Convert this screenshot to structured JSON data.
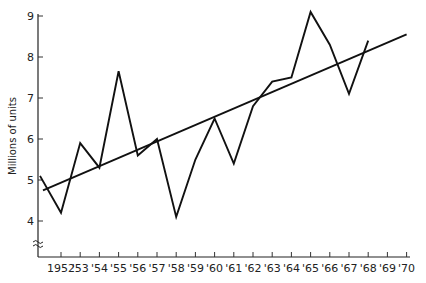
{
  "chart_data": {
    "type": "line",
    "title": "",
    "xlabel": "",
    "ylabel": "Millions of units",
    "ylim": [
      3.1,
      9.1
    ],
    "y_ticks": [
      4,
      5,
      6,
      7,
      8,
      9
    ],
    "y_axis_break": true,
    "grid": false,
    "legend": null,
    "x_ticks": [
      1952,
      1953,
      1954,
      1955,
      1956,
      1957,
      1958,
      1959,
      1960,
      1961,
      1962,
      1963,
      1964,
      1965,
      1966,
      1967,
      1968,
      1969,
      1970
    ],
    "x_tick_labels": [
      "1952",
      "'53",
      "'54",
      "'55",
      "'56",
      "'57",
      "'58",
      "'59",
      "'60",
      "'61",
      "'62",
      "'63",
      "'64",
      "'65",
      "'66",
      "'67",
      "'68",
      "'69",
      "'70"
    ],
    "series": [
      {
        "name": "Actual",
        "x": [
          1951,
          1952,
          1953,
          1954,
          1955,
          1956,
          1957,
          1958,
          1959,
          1960,
          1961,
          1962,
          1963,
          1964,
          1965,
          1966,
          1967,
          1968
        ],
        "values": [
          5.1,
          4.2,
          5.9,
          5.3,
          7.65,
          5.6,
          6.0,
          4.1,
          5.5,
          6.5,
          5.4,
          6.8,
          7.4,
          7.5,
          9.1,
          8.3,
          7.1,
          8.4
        ]
      },
      {
        "name": "Trend",
        "x": [
          1951,
          1970
        ],
        "values": [
          4.75,
          8.55
        ]
      }
    ]
  }
}
